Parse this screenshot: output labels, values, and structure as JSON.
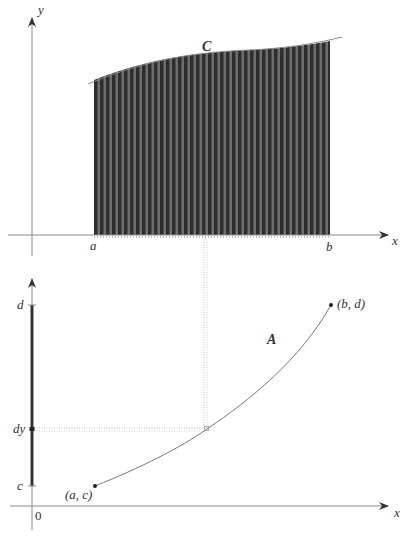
{
  "figure": {
    "top_plot": {
      "x_axis_label": "x",
      "y_axis_label": "y",
      "region_label": "C",
      "left_bound_label": "a",
      "right_bound_label": "b"
    },
    "bottom_plot": {
      "x_axis_label": "x",
      "origin_label": "0",
      "curve_label": "A",
      "y_upper_label": "d",
      "y_lower_label": "c",
      "y_element_label": "dy",
      "start_point_label": "(a, c)",
      "end_point_label": "(b, d)"
    },
    "colors": {
      "axis": "#8a8a8a",
      "fill_dark": "#3a3a3a",
      "fill_stripe": "#7a7a7a",
      "curve": "#777777",
      "thick_segment": "#333333",
      "dotted": "#bbbbbb",
      "text": "#333333"
    }
  }
}
